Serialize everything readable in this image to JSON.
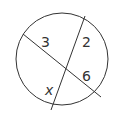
{
  "diagram": {
    "type": "intersecting-chords",
    "labels": {
      "segment_upper_left": "3",
      "segment_upper_right": "2",
      "segment_lower_right": "6",
      "segment_lower_left": "x"
    },
    "colors": {
      "stroke": "#333333",
      "background": "#ffffff"
    }
  }
}
